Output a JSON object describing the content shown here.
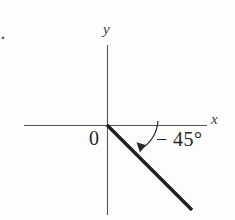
{
  "figure": {
    "item_marker": ".",
    "background_color": "#fdfdfc",
    "ink_color": "#2b2b2b",
    "axes": {
      "y_label": "y",
      "x_label": "x",
      "origin_label": "0",
      "x_axis": {
        "x1": 24,
        "y1": 125,
        "x2": 207,
        "y2": 125
      },
      "y_axis": {
        "x1": 107,
        "y1": 45,
        "x2": 107,
        "y2": 215
      }
    },
    "ray": {
      "label": "terminal-side",
      "angle_degrees": -45,
      "from": {
        "x": 107,
        "y": 125
      },
      "to": {
        "x": 192,
        "y": 210
      },
      "stroke_width": 3.4,
      "color": "#1e1e1e"
    },
    "angle_arc": {
      "label": "-45",
      "value_text": "− 45°",
      "start": {
        "x": 157,
        "y": 122
      },
      "end": {
        "x": 139,
        "y": 151
      },
      "radius": 36,
      "arrow_direction": "down-left"
    }
  }
}
